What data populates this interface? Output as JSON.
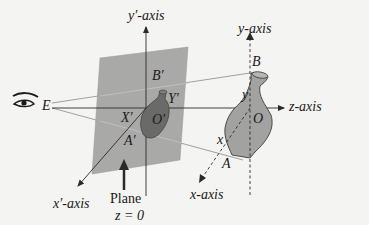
{
  "figure": {
    "type": "perspective-projection-diagram",
    "labels": {
      "y_prime_axis": "y′-axis",
      "y_axis": "y-axis",
      "z_axis": "z-axis",
      "x_prime_axis": "x′-axis",
      "x_axis": "x-axis",
      "eye_point": "E",
      "B_prime": "B′",
      "Y_prime": "Y′",
      "X_prime": "X′",
      "O_prime": "O′",
      "A_prime": "A′",
      "B": "B",
      "y": "y",
      "O": "O",
      "x": "x",
      "A": "A",
      "plane_line1": "Plane",
      "plane_line2": "z = 0"
    },
    "colors": {
      "plane": "#a9a9a7",
      "vase_small": "#6a6a68",
      "vase_large": "#a2a2a0",
      "lines": "#2a2a2a",
      "background": "#f4f4f2"
    }
  }
}
